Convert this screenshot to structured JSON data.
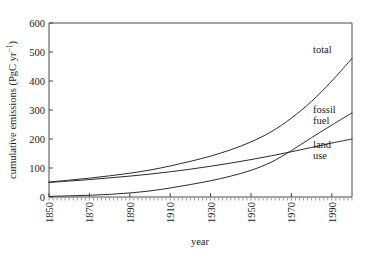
{
  "chart_data": {
    "type": "line",
    "title": "",
    "xlabel": "year",
    "ylabel": "cumulative emissions (PgC yr−1)",
    "ylabel_base": "cumulative emissions (PgC yr",
    "ylabel_exponent": "−1",
    "ylabel_close": ")",
    "xlim": [
      1850,
      2000
    ],
    "ylim": [
      0,
      600
    ],
    "grid": false,
    "legend_position": "inline-right-labels",
    "xticks": [
      1850,
      1870,
      1890,
      1910,
      1930,
      1950,
      1970,
      1990
    ],
    "xtick_labels": [
      "1850",
      "1870",
      "1890",
      "1910",
      "1930",
      "1950",
      "1970",
      "1990"
    ],
    "yticks": [
      0,
      100,
      200,
      300,
      400,
      500,
      600
    ],
    "ytick_labels": [
      "0",
      "100",
      "200",
      "300",
      "400",
      "500",
      "600"
    ],
    "series": [
      {
        "name": "total",
        "label": "total",
        "color": "#2b2b2b",
        "x": [
          1850,
          1860,
          1870,
          1880,
          1890,
          1900,
          1910,
          1920,
          1930,
          1940,
          1950,
          1960,
          1970,
          1980,
          1990,
          2000
        ],
        "values": [
          52,
          58,
          65,
          73,
          82,
          93,
          107,
          123,
          141,
          163,
          190,
          225,
          272,
          330,
          400,
          478
        ]
      },
      {
        "name": "fossil fuel",
        "label": "fossil fuel",
        "label_line1": "fossil",
        "label_line2": "fuel",
        "color": "#2b2b2b",
        "x": [
          1850,
          1860,
          1870,
          1880,
          1890,
          1900,
          1910,
          1920,
          1930,
          1940,
          1950,
          1960,
          1970,
          1980,
          1990,
          2000
        ],
        "values": [
          2,
          4,
          6,
          9,
          14,
          21,
          31,
          43,
          56,
          72,
          92,
          120,
          160,
          205,
          248,
          290
        ]
      },
      {
        "name": "land use",
        "label": "land use",
        "label_line1": "land",
        "label_line2": "use",
        "color": "#2b2b2b",
        "x": [
          1850,
          1860,
          1870,
          1880,
          1890,
          1900,
          1910,
          1920,
          1930,
          1940,
          1950,
          1960,
          1970,
          1980,
          1990,
          2000
        ],
        "values": [
          50,
          55,
          60,
          66,
          72,
          79,
          87,
          96,
          106,
          117,
          129,
          142,
          156,
          171,
          186,
          200
        ]
      }
    ]
  }
}
